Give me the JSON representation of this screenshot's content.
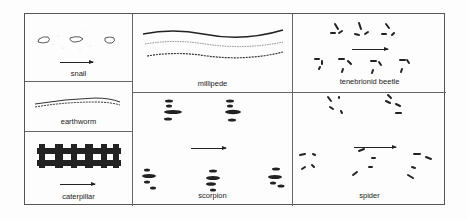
{
  "figure": {
    "panels": [
      {
        "id": "snail",
        "label": "snail"
      },
      {
        "id": "earthworm",
        "label": "earthworm"
      },
      {
        "id": "caterpillar",
        "label": "caterpillar"
      },
      {
        "id": "millipede",
        "label": "millipede"
      },
      {
        "id": "tenebrionid-beetle",
        "label": "tenebrionid beetle"
      },
      {
        "id": "scorpion",
        "label": "scorpion"
      },
      {
        "id": "spider",
        "label": "spider"
      }
    ],
    "direction_icon": "arrow-right-icon",
    "colors": {
      "ink": "#222222",
      "border": "#555555",
      "background": "#fdfdfd"
    }
  }
}
